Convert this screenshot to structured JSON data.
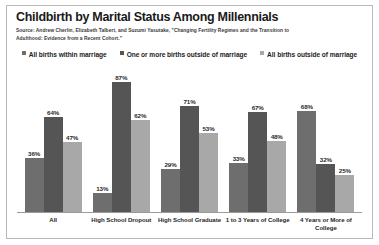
{
  "chart_data": {
    "type": "bar",
    "title": "Childbirth by Marital Status Among Millennials",
    "source": "Source: Andrew Cherlin, Elizabeth Talbert, and Suzumi Yasutake, \"Changing Fertility Regimes and the Transition to Adulthood: Evidence from a Recent Cohort.\"",
    "xlabel": "",
    "ylabel": "",
    "ylim": [
      0,
      100
    ],
    "grid": false,
    "legend_position": "top",
    "value_suffix": "%",
    "categories": [
      "All",
      "High School Dropout",
      "High School Graduate",
      "1 to 3 Years of College",
      "4 Years or More of College"
    ],
    "series": [
      {
        "name": "All births within marriage",
        "color": "#6e6e6e",
        "values": [
          36,
          13,
          29,
          33,
          68
        ]
      },
      {
        "name": "One or more births outside of marriage",
        "color": "#555555",
        "values": [
          64,
          87,
          71,
          67,
          32
        ]
      },
      {
        "name": "All births outside of marriage",
        "color": "#a8a8a8",
        "values": [
          47,
          62,
          53,
          48,
          25
        ]
      }
    ]
  },
  "style": {
    "background": "#ffffff",
    "border_color": "#b9b9b9",
    "axis_color": "#9a9a9a",
    "text_color": "#1f1f1f"
  }
}
